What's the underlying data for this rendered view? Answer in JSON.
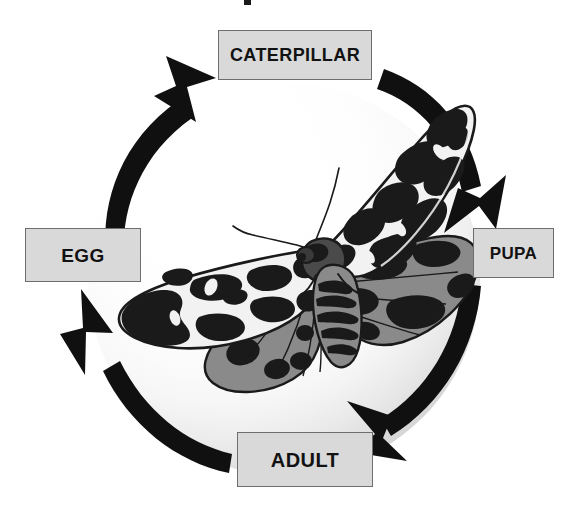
{
  "diagram": {
    "cycle_direction": "clockwise",
    "background_color": "#ffffff",
    "arrow_color": "#101010",
    "box_fill_color": "#d9d9d9",
    "box_border_color": "#6e6e6e",
    "box_text_color": "#121212",
    "sphere_light_color": "#ffffff",
    "sphere_shade_color": "#cfcfcf",
    "moth_dark_color": "#1a1a1a",
    "moth_gray_color": "#8a8a8a",
    "moth_light_color": "#f2f2f2"
  },
  "stages": {
    "caterpillar": {
      "label": "CATERPILLAR"
    },
    "pupa": {
      "label": "PUPA"
    },
    "adult": {
      "label": "ADULT"
    },
    "egg": {
      "label": "EGG"
    }
  },
  "arrows": [
    {
      "name": "egg-to-caterpillar",
      "from": "EGG",
      "to": "CATERPILLAR"
    },
    {
      "name": "caterpillar-to-pupa",
      "from": "CATERPILLAR",
      "to": "PUPA"
    },
    {
      "name": "pupa-to-adult",
      "from": "PUPA",
      "to": "ADULT"
    },
    {
      "name": "adult-to-egg",
      "from": "ADULT",
      "to": "EGG"
    }
  ],
  "illustration": {
    "name": "garden-tiger-moth",
    "description": "Adult moth with mottled black-and-white forewings and gray hindwings, wings spread"
  }
}
